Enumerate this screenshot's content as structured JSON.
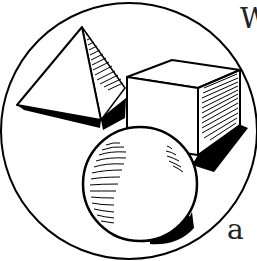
{
  "figure": {
    "shapes": [
      "pyramid",
      "cube",
      "sphere"
    ],
    "frame": "circle",
    "colors": {
      "ink": "#000000",
      "paper": "#ffffff",
      "text": "#222222"
    }
  },
  "text_fragments": {
    "top_right": "W",
    "bottom_right": "a"
  }
}
